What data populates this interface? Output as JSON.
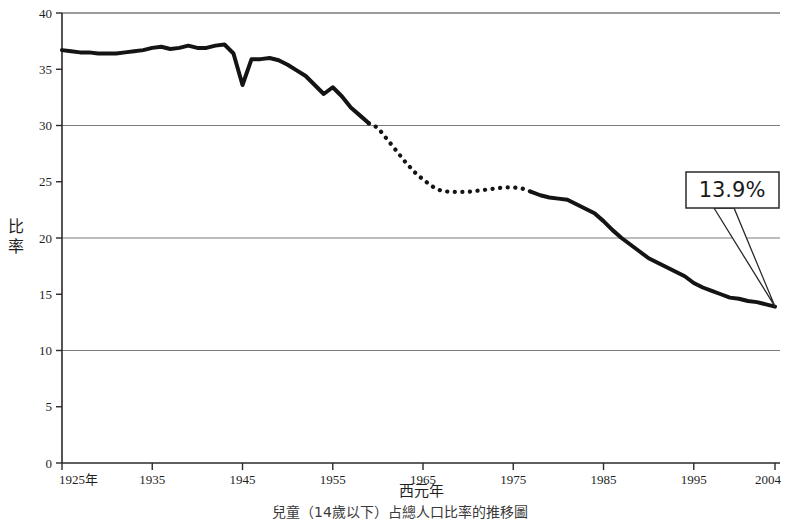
{
  "chart_data": {
    "type": "line",
    "title": "",
    "caption": "兒童（14歲以下）占總人口比率的推移圖",
    "xlabel": "西元年",
    "ylabel": "比率",
    "xlim": [
      1925,
      2004
    ],
    "ylim": [
      0,
      40
    ],
    "grid": true,
    "grid_values": [
      10,
      20,
      30,
      40
    ],
    "legend": "none",
    "ytick_labels": [
      "0",
      "5",
      "10",
      "15",
      "20",
      "25",
      "30",
      "35",
      "40"
    ],
    "ytick_values": [
      0,
      5,
      10,
      15,
      20,
      25,
      30,
      35,
      40
    ],
    "xtick_labels": [
      "1925年",
      "1935",
      "1945",
      "1955",
      "1965",
      "1975",
      "1985",
      "1995",
      "2004"
    ],
    "xtick_values": [
      1925,
      1935,
      1945,
      1955,
      1965,
      1975,
      1985,
      1995,
      2004
    ],
    "annotations": [
      {
        "label": "13.9%",
        "points_to_x": 2004,
        "points_to_y": 13.9
      }
    ],
    "series": [
      {
        "name": "兒童人口比率",
        "style": "solid",
        "segment": "observed-early",
        "x": [
          1925,
          1926,
          1927,
          1928,
          1929,
          1930,
          1931,
          1932,
          1933,
          1934,
          1935,
          1936,
          1937,
          1938,
          1939,
          1940,
          1941,
          1942,
          1943,
          1944,
          1945,
          1946,
          1947,
          1948,
          1949,
          1950,
          1951,
          1952,
          1953,
          1954,
          1955,
          1956,
          1957,
          1958,
          1959
        ],
        "values": [
          36.7,
          36.6,
          36.5,
          36.5,
          36.4,
          36.4,
          36.4,
          36.5,
          36.6,
          36.7,
          36.9,
          37.0,
          36.8,
          36.9,
          37.1,
          36.9,
          36.9,
          37.1,
          37.2,
          36.4,
          33.6,
          35.9,
          35.9,
          36.0,
          35.8,
          35.4,
          34.9,
          34.4,
          33.6,
          32.8,
          33.4,
          32.6,
          31.6,
          30.9,
          30.2
        ]
      },
      {
        "name": "兒童人口比率（推估）",
        "style": "dotted",
        "segment": "estimated-middle",
        "x": [
          1959,
          1960,
          1961,
          1962,
          1963,
          1964,
          1965,
          1966,
          1967,
          1968,
          1969,
          1970,
          1971,
          1972,
          1973,
          1974,
          1975,
          1976,
          1977
        ],
        "values": [
          30.2,
          29.8,
          28.8,
          27.8,
          26.8,
          25.9,
          25.2,
          24.6,
          24.2,
          24.1,
          24.1,
          24.1,
          24.2,
          24.3,
          24.4,
          24.5,
          24.5,
          24.4,
          24.1
        ]
      },
      {
        "name": "兒童人口比率（後期）",
        "style": "solid",
        "segment": "observed-late",
        "x": [
          1977,
          1978,
          1979,
          1980,
          1981,
          1982,
          1983,
          1984,
          1985,
          1986,
          1987,
          1988,
          1989,
          1990,
          1991,
          1992,
          1993,
          1994,
          1995,
          1996,
          1997,
          1998,
          1999,
          2000,
          2001,
          2002,
          2003,
          2004
        ],
        "values": [
          24.1,
          23.8,
          23.6,
          23.5,
          23.4,
          23.0,
          22.6,
          22.2,
          21.5,
          20.7,
          20.0,
          19.4,
          18.8,
          18.2,
          17.8,
          17.4,
          17.0,
          16.6,
          16.0,
          15.6,
          15.3,
          15.0,
          14.7,
          14.6,
          14.4,
          14.3,
          14.1,
          13.9
        ]
      }
    ]
  },
  "ylabel_chars": [
    "比",
    "率"
  ],
  "icons": {
    "callout_pointer": "callout-pointer-icon"
  },
  "colors": {
    "line": "#141414",
    "grid": "#7a7a7a",
    "axis": "#2a2a2a",
    "text": "#1f1f1f",
    "background": "#ffffff"
  }
}
